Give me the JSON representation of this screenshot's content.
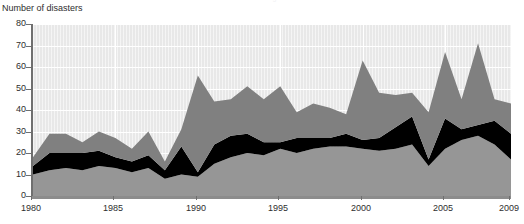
{
  "clipped_title": "Figure",
  "axis": {
    "y_title": "Number of disasters",
    "y_ticks": [
      0,
      10,
      20,
      30,
      40,
      50,
      60,
      70,
      80
    ],
    "x_ticks": [
      "1980",
      "1985",
      "1990",
      "1995",
      "2000",
      "2005",
      "2009"
    ]
  },
  "colors": {
    "plot_background": "#e8e8e8",
    "gridline": "#ffffff",
    "series_bottom": "#969696",
    "series_middle": "#000000",
    "series_top": "#808080",
    "axis": "#6f6f6f",
    "text": "#2e2e2e"
  },
  "chart_data": {
    "type": "area",
    "stacked": true,
    "title": "",
    "xlabel": "",
    "ylabel": "Number of disasters",
    "ylim": [
      0,
      80
    ],
    "xlim": [
      1980,
      2009
    ],
    "grid": true,
    "legend": "none",
    "x": [
      1980,
      1981,
      1982,
      1983,
      1984,
      1985,
      1986,
      1987,
      1988,
      1989,
      1990,
      1991,
      1992,
      1993,
      1994,
      1995,
      1996,
      1997,
      1998,
      1999,
      2000,
      2001,
      2002,
      2003,
      2004,
      2005,
      2006,
      2007,
      2008,
      2009
    ],
    "series": [
      {
        "name": "series-bottom",
        "values": [
          10,
          12,
          13,
          12,
          14,
          13,
          11,
          13,
          8,
          10,
          9,
          15,
          18,
          20,
          19,
          22,
          20,
          22,
          23,
          23,
          22,
          21,
          22,
          24,
          14,
          22,
          26,
          28,
          24,
          17
        ]
      },
      {
        "name": "series-middle",
        "values": [
          4,
          8,
          7,
          8,
          7,
          5,
          5,
          6,
          4,
          13,
          2,
          9,
          10,
          9,
          6,
          3,
          7,
          5,
          4,
          6,
          4,
          6,
          10,
          13,
          3,
          14,
          5,
          5,
          11,
          12
        ]
      },
      {
        "name": "series-top",
        "values": [
          4,
          9,
          9,
          5,
          9,
          9,
          6,
          11,
          4,
          8,
          45,
          20,
          17,
          22,
          20,
          26,
          12,
          16,
          14,
          9,
          37,
          21,
          15,
          11,
          22,
          31,
          14,
          38,
          10,
          14
        ]
      }
    ],
    "totals": [
      18,
      29,
      29,
      25,
      30,
      27,
      22,
      30,
      16,
      31,
      56,
      44,
      45,
      51,
      45,
      51,
      39,
      43,
      41,
      38,
      63,
      48,
      47,
      48,
      39,
      67,
      45,
      71,
      45,
      43
    ]
  }
}
